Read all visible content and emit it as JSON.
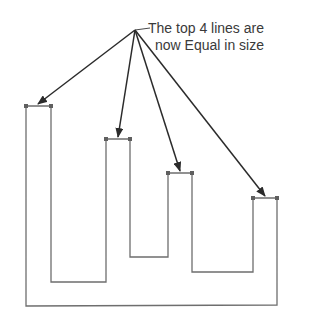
{
  "annotation": {
    "line1": "The top 4 lines are",
    "line2": "now Equal in size"
  },
  "colors": {
    "shape_stroke": "#6e6e6e",
    "arrow_stroke": "#2b2b2b",
    "vertex": "#5f5f5f",
    "text": "#3a3a3a"
  },
  "diagram": {
    "apex": [
      135,
      30
    ],
    "outline_points": [
      [
        26,
        306
      ],
      [
        26,
        106
      ],
      [
        51,
        106
      ],
      [
        51,
        282
      ],
      [
        106,
        282
      ],
      [
        106,
        139
      ],
      [
        130,
        139
      ],
      [
        130,
        257
      ],
      [
        168,
        257
      ],
      [
        168,
        173
      ],
      [
        192,
        173
      ],
      [
        192,
        272
      ],
      [
        253,
        272
      ],
      [
        253,
        198
      ],
      [
        277,
        198
      ],
      [
        277,
        305
      ]
    ],
    "top_segments": [
      {
        "x1": 26,
        "x2": 51,
        "y": 106
      },
      {
        "x1": 106,
        "x2": 130,
        "y": 139
      },
      {
        "x1": 168,
        "x2": 192,
        "y": 173
      },
      {
        "x1": 253,
        "x2": 277,
        "y": 198
      }
    ]
  }
}
